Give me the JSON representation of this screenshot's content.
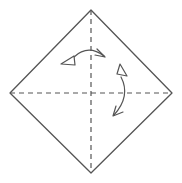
{
  "colors": {
    "background": "#ffffff",
    "line": "#555555"
  },
  "diagram": {
    "type": "origami-step",
    "paper_outline": "M 91 10 L 172 93 L 91 173 L 10 93 Z",
    "creases": {
      "vertical": "M 91 10 L 91 173",
      "horizontal": "M 10 93 L 172 93",
      "dash_pattern": "5 4"
    },
    "arrows": {
      "horizontal_fold": {
        "label": "fold-and-unfold-left-right",
        "arc": "M 74 57 Q 88 44 104 56",
        "head_lines": "M 105 57 L 97 49 M 105 57 L 95 55",
        "head_triangle": "M 61 64 L 74 56 L 75 65 Z"
      },
      "vertical_fold": {
        "label": "fold-and-unfold-up-down",
        "arc": "M 121 77 Q 131 96 114 115",
        "head_lines": "M 113 116 L 116 106 M 113 116 L 123 112",
        "head_triangle": "M 120 64 L 127 76 L 117 74 Z"
      }
    }
  }
}
